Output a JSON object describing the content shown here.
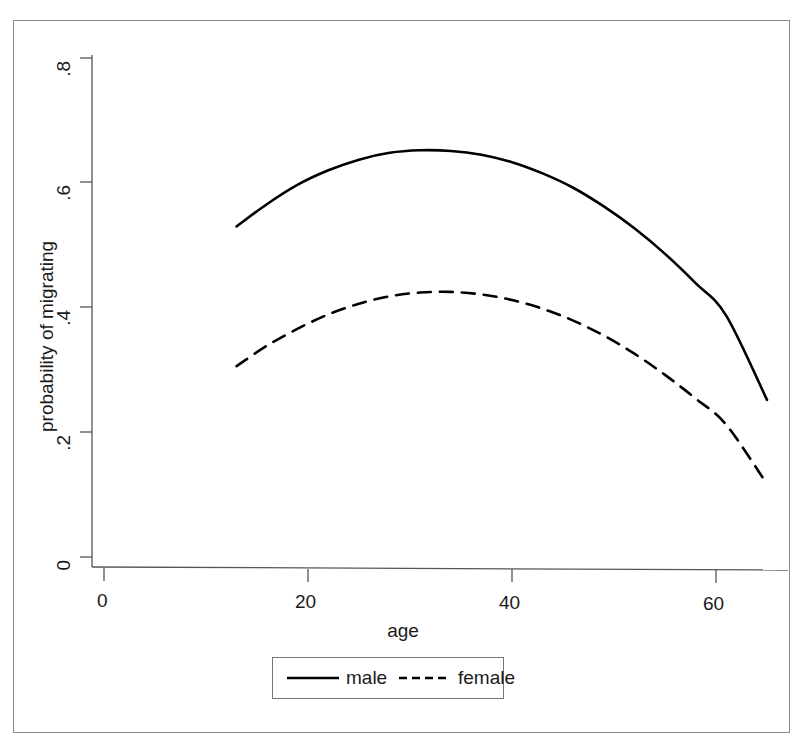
{
  "chart_data": {
    "type": "line",
    "title": "",
    "xlabel": "age",
    "ylabel": "probability of migrating",
    "xlim": [
      0,
      68.5
    ],
    "ylim": [
      0,
      0.845
    ],
    "xticks": [
      "0",
      "20",
      "40",
      "60"
    ],
    "xtick_values": [
      0,
      20,
      40,
      60
    ],
    "yticks": [
      "0",
      ".2",
      ".4",
      ".6",
      ".8"
    ],
    "ytick_values": [
      0,
      0.2,
      0.4,
      0.6,
      0.8
    ],
    "grid": false,
    "legend_position": "below-axis",
    "x": [
      13,
      16,
      19,
      22,
      25,
      28,
      31,
      34,
      37,
      40,
      43,
      46,
      49,
      52,
      55,
      58,
      61,
      65
    ],
    "series": [
      {
        "name": "male",
        "style": "solid",
        "color": "#000000",
        "values": [
          0.53,
          0.566,
          0.597,
          0.62,
          0.637,
          0.648,
          0.652,
          0.651,
          0.645,
          0.633,
          0.615,
          0.592,
          0.562,
          0.527,
          0.486,
          0.439,
          0.387,
          0.252
        ]
      },
      {
        "name": "female",
        "style": "dashed",
        "color": "#000000",
        "values": [
          0.306,
          0.339,
          0.366,
          0.389,
          0.406,
          0.418,
          0.424,
          0.425,
          0.421,
          0.412,
          0.398,
          0.379,
          0.355,
          0.326,
          0.292,
          0.254,
          0.212,
          0.117
        ]
      }
    ]
  },
  "legend": {
    "entries": [
      {
        "label": "male",
        "style": "solid"
      },
      {
        "label": "female",
        "style": "dashed"
      }
    ]
  }
}
